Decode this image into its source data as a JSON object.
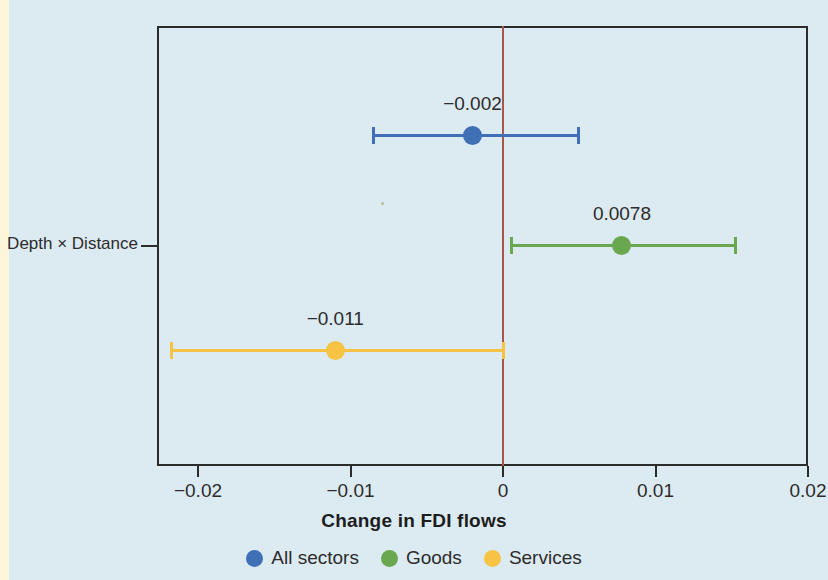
{
  "figure": {
    "background_color": "#dceaf2",
    "page_edge_color": "#fdf6da",
    "frame_color": "#2b2b2b",
    "zero_line_color": "#a8564a"
  },
  "axis": {
    "x_title": "Change in FDI flows",
    "x_ticks": [
      "−0.02",
      "−0.01",
      "0",
      "0.01",
      "0.02"
    ],
    "y_tick_label": "Depth × Distance"
  },
  "legend": {
    "items": [
      {
        "label": "All sectors",
        "color": "#3f6fb5"
      },
      {
        "label": "Goods",
        "color": "#6aa84f"
      },
      {
        "label": "Services",
        "color": "#f6c344"
      }
    ]
  },
  "chart_data": {
    "type": "scatter",
    "title": "",
    "subtitle": "",
    "xlabel": "Change in FDI flows",
    "ylabel": "",
    "xlim": [
      -0.023,
      0.02
    ],
    "xticks": [
      -0.02,
      -0.01,
      0,
      0.01,
      0.02
    ],
    "xticklabels": [
      "−0.02",
      "−0.01",
      "0",
      "0.01",
      "0.02"
    ],
    "yticks": [
      "Depth × Distance"
    ],
    "grid": false,
    "legend_position": "bottom",
    "reference_line": {
      "x": 0,
      "color": "#a8564a"
    },
    "orientation": "horizontal",
    "categories": [
      "Depth × Distance"
    ],
    "series": [
      {
        "name": "All sectors",
        "color": "#3f6fb5",
        "estimate": -0.002,
        "label": "−0.002",
        "ci_low": -0.0085,
        "ci_high": 0.0049
      },
      {
        "name": "Goods",
        "color": "#6aa84f",
        "estimate": 0.0078,
        "label": "0.0078",
        "ci_low": 0.0005,
        "ci_high": 0.0152
      },
      {
        "name": "Services",
        "color": "#f6c344",
        "estimate": -0.011,
        "label": "−0.011",
        "ci_low": -0.0218,
        "ci_high": 0.0
      }
    ]
  }
}
